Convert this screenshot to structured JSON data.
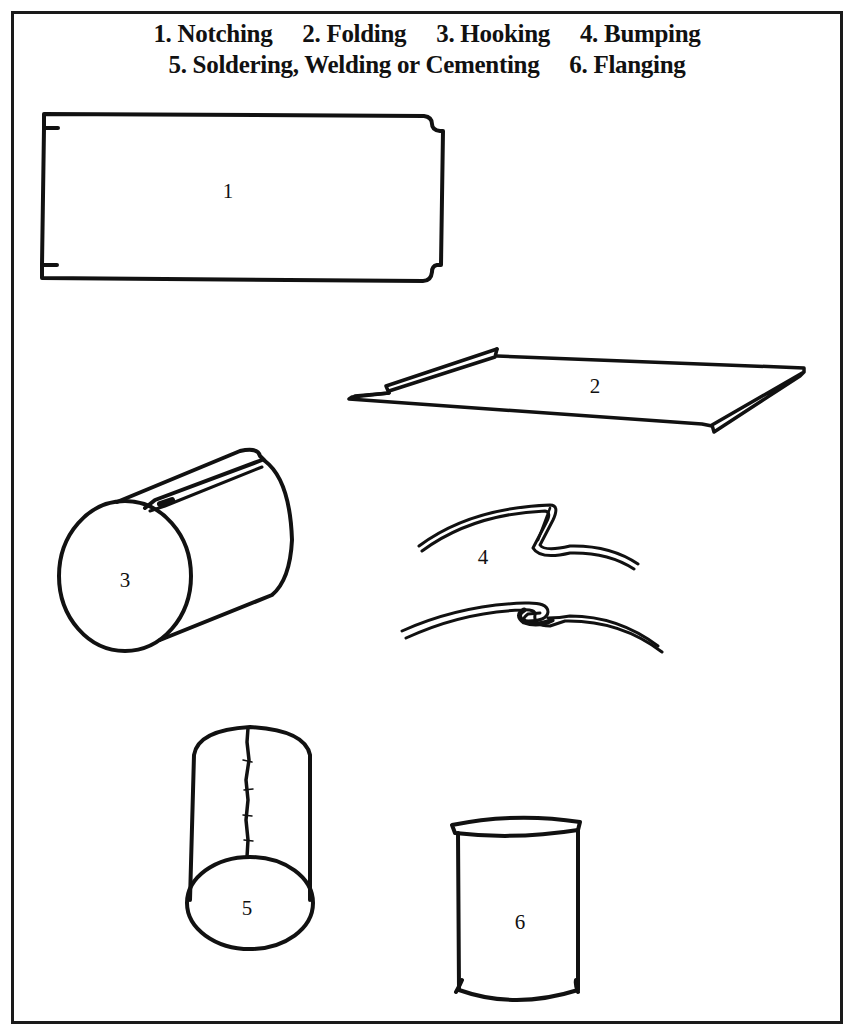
{
  "legend": {
    "line1": [
      {
        "label": "1. Notching"
      },
      {
        "label": "2. Folding"
      },
      {
        "label": "3. Hooking"
      },
      {
        "label": "4. Bumping"
      }
    ],
    "line2": [
      {
        "label": "5. Soldering, Welding or Cementing"
      },
      {
        "label": "6. Flanging"
      }
    ]
  },
  "figures": [
    {
      "id": "1",
      "label": "1",
      "depicts": "notched flat sheet"
    },
    {
      "id": "2",
      "label": "2",
      "depicts": "sheet with folded edges"
    },
    {
      "id": "3",
      "label": "3",
      "depicts": "cylinder with hooked seam"
    },
    {
      "id": "4",
      "label": "4",
      "depicts": "bumped seam cross-sections"
    },
    {
      "id": "5",
      "label": "5",
      "depicts": "cylinder with soldered seam"
    },
    {
      "id": "6",
      "label": "6",
      "depicts": "flanged cylinder"
    }
  ],
  "colors": {
    "ink": "#111111",
    "paper": "#ffffff"
  }
}
